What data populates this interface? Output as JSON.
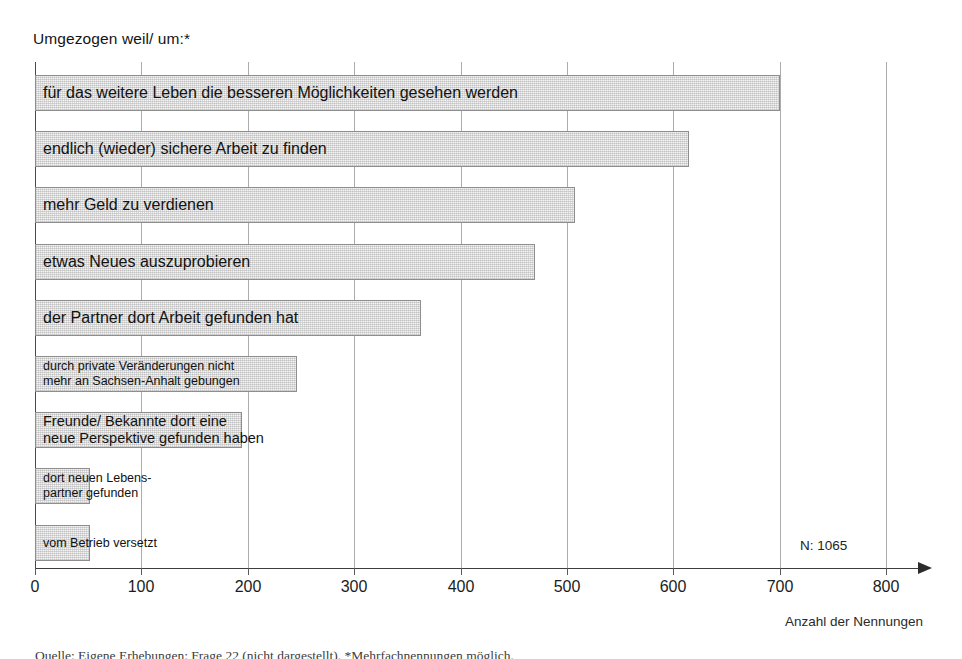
{
  "chart_data": {
    "type": "bar",
    "orientation": "horizontal",
    "title": "Umgezogen weil/ um:*",
    "xlabel": "Anzahl der Nennungen",
    "ylabel": "",
    "xlim": [
      0,
      800
    ],
    "xticks": [
      0,
      100,
      200,
      300,
      400,
      500,
      600,
      700,
      800
    ],
    "grid": true,
    "legend": null,
    "annotation": "N: 1065",
    "source_caption": "Quelle: Eigene Erhebungen; Frage 22 (nicht dargestellt). *Mehrfachnennungen möglich.",
    "categories": [
      "für das weitere Leben die besseren Möglichkeiten gesehen werden",
      "endlich (wieder) sichere Arbeit zu finden",
      "mehr Geld zu verdienen",
      "etwas Neues auszuprobieren",
      "der Partner dort Arbeit gefunden hat",
      "durch private Veränderungen nicht mehr an Sachsen-Anhalt gebungen",
      "Freunde/ Bekannte dort eine neue Perspektive gefunden haben",
      "dort neuen Lebenspartner gefunden",
      "vom Betrieb versetzt"
    ],
    "values": [
      700,
      615,
      508,
      470,
      363,
      246,
      195,
      52,
      52
    ]
  },
  "bars": [
    {
      "label_line1": "für das weitere Leben die besseren Möglichkeiten gesehen werden",
      "label_line2": "",
      "value": 700,
      "size": "lg"
    },
    {
      "label_line1": "endlich (wieder) sichere Arbeit zu finden",
      "label_line2": "",
      "value": 615,
      "size": "lg"
    },
    {
      "label_line1": "mehr Geld zu verdienen",
      "label_line2": "",
      "value": 508,
      "size": "lg"
    },
    {
      "label_line1": "etwas Neues auszuprobieren",
      "label_line2": "",
      "value": 470,
      "size": "lg"
    },
    {
      "label_line1": "der Partner dort Arbeit gefunden hat",
      "label_line2": "",
      "value": 363,
      "size": "lg"
    },
    {
      "label_line1": "durch private Veränderungen nicht",
      "label_line2": "mehr an Sachsen-Anhalt gebungen",
      "value": 246,
      "size": "sm"
    },
    {
      "label_line1": "Freunde/ Bekannte dort eine",
      "label_line2": "neue Perspektive gefunden haben",
      "value": 195,
      "size": "md"
    },
    {
      "label_line1": "dort neuen Lebens-",
      "label_line2": "partner gefunden",
      "value": 52,
      "size": "sm"
    },
    {
      "label_line1": "vom Betrieb versetzt",
      "label_line2": "",
      "value": 52,
      "size": "sm"
    }
  ],
  "axis": {
    "ticks": [
      "0",
      "100",
      "200",
      "300",
      "400",
      "500",
      "600",
      "700",
      "800"
    ],
    "title": "Anzahl der Nennungen"
  },
  "note": {
    "n_label": "N: 1065"
  },
  "colors": {
    "bar_fill": "#f4f4f4",
    "bar_border": "#8e8e8e",
    "gridline": "#acacac",
    "axis": "#3d3d3d",
    "text": "#141414"
  }
}
